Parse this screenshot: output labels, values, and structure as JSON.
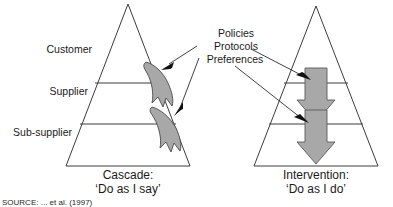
{
  "figure": {
    "tier_labels": [
      {
        "id": "customer",
        "text": "Customer"
      },
      {
        "id": "supplier",
        "text": "Supplier"
      },
      {
        "id": "sub-supplier",
        "text": "Sub-supplier"
      }
    ],
    "callout": {
      "line1": "Policies",
      "line2": "Protocols",
      "line3": "Preferences"
    },
    "left_model": {
      "caption_title": "Cascade:",
      "caption_quote": "‘Do as I say’",
      "arrow_style": "curved-swoosh-down-right"
    },
    "right_model": {
      "caption_title": "Intervention:",
      "caption_quote": "‘Do as I do’",
      "arrow_style": "straight-block-down"
    },
    "source_note": "SOURCE: ... et al. (1997)",
    "colors": {
      "arrow_fill": "#a8a8a8",
      "arrow_stroke": "#5a5a5a",
      "line": "#3c3c3c",
      "text": "#1a1a1a",
      "background": "#ffffff"
    }
  }
}
